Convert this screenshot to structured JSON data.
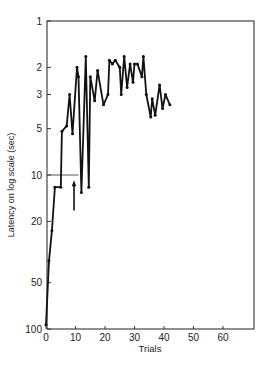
{
  "chart_data": {
    "type": "line",
    "title": "",
    "xlabel": "Trials",
    "ylabel": "Latency on log scale (sec)",
    "yscale": "log",
    "ylim": [
      100,
      1
    ],
    "xlim": [
      0,
      70
    ],
    "x_ticks": [
      0,
      10,
      20,
      30,
      40,
      50,
      60
    ],
    "y_ticks": [
      1,
      2,
      3,
      5,
      10,
      20,
      50,
      100
    ],
    "grid": false,
    "legend": null,
    "reference_line": {
      "y": 10,
      "x_from": 0,
      "x_to": 11
    },
    "annotation_arrow": {
      "x": 9.5,
      "y_from": 17,
      "y_to": 11
    },
    "series": [
      {
        "name": "Latency",
        "x": [
          0,
          1,
          2,
          3,
          5,
          5.4,
          7,
          8,
          9,
          10.5,
          11,
          12,
          13.5,
          14.5,
          15,
          16.5,
          17.5,
          19.5,
          21,
          21.5,
          22.5,
          23.5,
          25,
          25.5,
          26.5,
          27.5,
          28.5,
          29.5,
          30,
          31,
          32.5,
          33,
          34,
          35.5,
          36,
          37,
          38.5,
          39.5,
          40.5,
          42
        ],
        "values": [
          94,
          36,
          23,
          12,
          12,
          5.2,
          4.8,
          3.0,
          5.4,
          2.0,
          2.3,
          13,
          1.7,
          12,
          2.3,
          3.3,
          2.1,
          3.5,
          3.0,
          1.8,
          1.9,
          1.8,
          2.0,
          3.0,
          1.7,
          2.7,
          1.9,
          2.5,
          1.9,
          1.9,
          2.3,
          1.7,
          3.0,
          4.2,
          3.2,
          4.1,
          2.6,
          3.7,
          3.0,
          3.5
        ]
      }
    ]
  },
  "labels": {
    "xlabel": "Trials",
    "ylabel": "Latency on log scale (sec)"
  },
  "style": {
    "line_color": "#111111",
    "axis_color": "#333333",
    "background": "#ffffff"
  }
}
